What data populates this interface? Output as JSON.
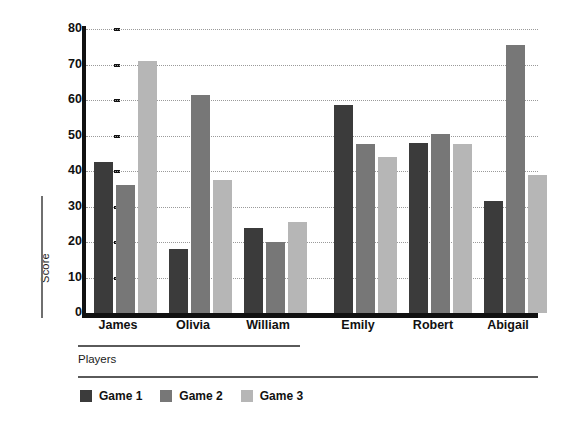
{
  "chart_data": {
    "type": "bar",
    "title": "",
    "xlabel": "Players",
    "ylabel": "Score",
    "categories": [
      "James",
      "Olivia",
      "William",
      "Emily",
      "Robert",
      "Abigail"
    ],
    "series": [
      {
        "name": "Game 1",
        "color": "#3b3b3b",
        "values": [
          42.5,
          18,
          24,
          58.5,
          48,
          31.5
        ]
      },
      {
        "name": "Game 2",
        "color": "#777777",
        "values": [
          36,
          61.5,
          20,
          47.5,
          50.5,
          75.5
        ]
      },
      {
        "name": "Game 3",
        "color": "#b6b6b6",
        "values": [
          71,
          37.5,
          25.5,
          44,
          47.5,
          39
        ]
      }
    ],
    "ylim": [
      0,
      80
    ],
    "yticks": [
      0,
      10,
      20,
      30,
      40,
      50,
      60,
      70,
      80
    ],
    "ytick_labels": [
      "0",
      "10",
      "20",
      "30",
      "40",
      "50",
      "60",
      "70",
      "80"
    ],
    "grid": true,
    "grid_style": "dotted-horizontal",
    "legend_position": "bottom-left",
    "orientation": "vertical",
    "background": "#ffffff"
  }
}
